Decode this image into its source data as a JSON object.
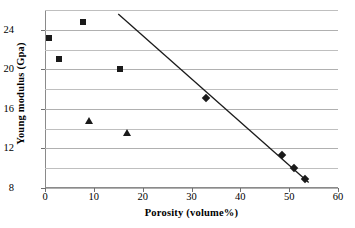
{
  "chart_data": {
    "type": "scatter",
    "title": "",
    "xlabel": "Porosity (volume%)",
    "ylabel": "Young modulus (Gpa)",
    "xlim": [
      0,
      60
    ],
    "ylim": [
      8,
      26
    ],
    "xticks": [
      0,
      10,
      20,
      30,
      40,
      50,
      60
    ],
    "yticks": [
      8,
      12,
      16,
      20,
      24
    ],
    "gridlines_y": [
      8,
      10,
      12,
      14,
      16,
      18,
      20,
      22,
      24,
      26
    ],
    "grid": true,
    "legend": "none",
    "marker_color": "#1a1a1a",
    "gridline_color": "#bfbfbf",
    "series": [
      {
        "name": "squares",
        "marker": "square",
        "points": [
          {
            "x": 0.8,
            "y": 23.2
          },
          {
            "x": 2.8,
            "y": 21.0
          },
          {
            "x": 7.8,
            "y": 24.8
          },
          {
            "x": 15.3,
            "y": 20.0
          }
        ]
      },
      {
        "name": "triangles",
        "marker": "triangle",
        "points": [
          {
            "x": 9.1,
            "y": 14.9
          },
          {
            "x": 16.7,
            "y": 13.7
          }
        ]
      },
      {
        "name": "diamonds",
        "marker": "diamond",
        "points": [
          {
            "x": 33.0,
            "y": 17.1
          },
          {
            "x": 48.6,
            "y": 11.3
          },
          {
            "x": 50.9,
            "y": 10.0
          },
          {
            "x": 53.2,
            "y": 8.9
          }
        ]
      }
    ],
    "trendline": {
      "name": "linear-fit",
      "x0": 15.0,
      "y0": 25.6,
      "x1": 54.0,
      "y1": 8.55,
      "color": "#1a1a1a",
      "width": 1.3
    }
  },
  "xtick_labels": [
    "0",
    "10",
    "20",
    "30",
    "40",
    "50",
    "60"
  ],
  "ytick_labels": [
    "8",
    "12",
    "16",
    "20",
    "24"
  ]
}
